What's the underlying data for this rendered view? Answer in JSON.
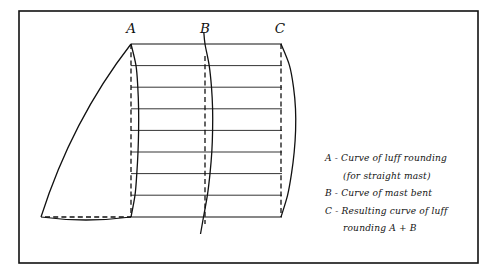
{
  "figure": {
    "background_color": "#ffffff",
    "ink_color": "#111111",
    "frame": {
      "x": 19,
      "y": 11,
      "width": 459,
      "height": 252,
      "stroke_width": 1.6
    }
  },
  "station_labels": [
    {
      "id": "A",
      "text": "A",
      "x": 131,
      "y": 33
    },
    {
      "id": "B",
      "text": "B",
      "x": 205,
      "y": 33
    },
    {
      "id": "C",
      "text": "C",
      "x": 280,
      "y": 33
    }
  ],
  "legend": {
    "x": 325,
    "start_y": 161,
    "line_height": 17.5,
    "lines": [
      {
        "text": "A - Curve of luff rounding",
        "indent": 0
      },
      {
        "text": "(for straight mast)",
        "indent": 18
      },
      {
        "text": "B - Curve of mast bent",
        "indent": 0
      },
      {
        "text": "C - Resulting curve of luff",
        "indent": 0
      },
      {
        "text": "rounding  A + B",
        "indent": 18
      }
    ]
  },
  "chart_data": {
    "type": "line",
    "xlabel": "",
    "ylabel": "",
    "geometry": {
      "head_y": 44,
      "foot_y": 217,
      "station_count": 9,
      "station_ys": [
        44,
        65.6,
        87.2,
        108.8,
        130.4,
        152,
        173.6,
        195.2,
        217
      ],
      "station_line_x_start": 131,
      "station_line_x_end": 282,
      "mast_x": 131,
      "bent_mast_axis_x": 205,
      "result_axis_x": 281,
      "clew_x": 41,
      "clew_y": 217
    },
    "curves": [
      {
        "name": "A",
        "label": "Curve of luff rounding (for straight mast)",
        "style": "solid",
        "role": "luff-rounding",
        "baseline_x": 131,
        "offsets_px": [
          0,
          5.0,
          6.8,
          7.6,
          7.6,
          7.0,
          5.8,
          4.0,
          0
        ]
      },
      {
        "name": "B",
        "label": "Curve of mast bent",
        "style": "solid",
        "role": "mast-bend",
        "baseline_x": 205,
        "offsets_px": [
          0,
          4.2,
          6.5,
          7.6,
          7.6,
          6.8,
          5.0,
          2.4,
          -1.5
        ]
      },
      {
        "name": "C",
        "label": "Resulting curve of luff rounding A + B",
        "style": "solid",
        "role": "resulting-luff",
        "baseline_x": 281,
        "offsets_px": [
          0,
          8.5,
          12.5,
          14.5,
          14.6,
          13.2,
          10.5,
          6.6,
          0
        ]
      }
    ],
    "dashed_references": [
      {
        "name": "mast-straight-line",
        "x": 131,
        "y1": 44,
        "y2": 217
      },
      {
        "name": "bent-mast-centre-line",
        "x": 205,
        "y1": 56,
        "y2": 224
      },
      {
        "name": "result-reference-line",
        "x": 281,
        "y1": 44,
        "y2": 217
      },
      {
        "name": "foot-straight-line",
        "x1": 45,
        "x2": 131,
        "y": 217
      }
    ],
    "sail_outline": {
      "head": [
        131,
        44
      ],
      "clew": [
        41,
        217
      ],
      "leech_control": [
        72,
        120
      ],
      "foot_sag_px": 6
    }
  }
}
